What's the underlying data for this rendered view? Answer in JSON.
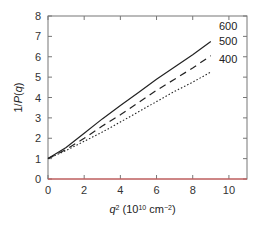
{
  "chart_data": {
    "type": "line",
    "title": "",
    "xlabel": "q² (10¹⁰ cm⁻²)",
    "ylabel": "1/P(q)",
    "xlim": [
      0,
      11
    ],
    "ylim": [
      0,
      8
    ],
    "xticks": [
      0,
      2,
      4,
      6,
      8,
      10
    ],
    "yticks": [
      0,
      1,
      2,
      3,
      4,
      5,
      6,
      7,
      8
    ],
    "grid": false,
    "series": [
      {
        "name": "600",
        "style": "solid",
        "x": [
          0,
          1,
          2,
          3,
          4,
          5,
          6,
          7,
          8,
          9
        ],
        "values": [
          1.0,
          1.55,
          2.25,
          2.95,
          3.6,
          4.25,
          4.9,
          5.5,
          6.1,
          6.75
        ]
      },
      {
        "name": "500",
        "style": "dashed",
        "x": [
          0,
          1,
          2,
          3,
          4,
          5,
          6,
          7,
          8,
          9
        ],
        "values": [
          1.0,
          1.45,
          2.0,
          2.6,
          3.15,
          3.75,
          4.35,
          4.9,
          5.45,
          6.05
        ]
      },
      {
        "name": "400",
        "style": "dotted",
        "x": [
          0,
          1,
          2,
          3,
          4,
          5,
          6,
          7,
          8,
          9
        ],
        "values": [
          1.0,
          1.4,
          1.85,
          2.3,
          2.8,
          3.3,
          3.8,
          4.3,
          4.75,
          5.25
        ]
      }
    ],
    "reference_line": {
      "y": 0,
      "color": "#e05050"
    },
    "legend": {
      "position": "right-of-line-ends",
      "entries": [
        "600",
        "500",
        "400"
      ]
    }
  },
  "labels": {
    "ylabel": "1/P(q)",
    "xlabel_main": "q",
    "xlabel_rest": " (10",
    "xlabel_exp": "10",
    "xlabel_unit": " cm",
    "xlabel_unit_exp": "−2",
    "xlabel_close": ")"
  }
}
